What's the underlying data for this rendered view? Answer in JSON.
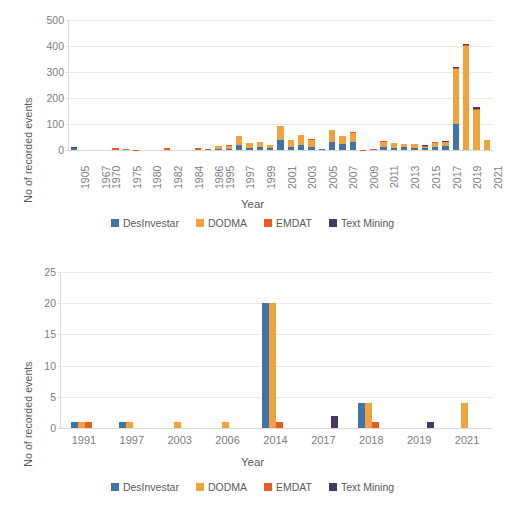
{
  "series_colors": {
    "DesInventar": "#4472a8",
    "DODMA": "#f0a33c",
    "EMDAT": "#ec5b23",
    "Text Mining": "#463963"
  },
  "legend": {
    "items": [
      {
        "label": "DesInvestar",
        "color": "#4472a8",
        "key": "DesInventar"
      },
      {
        "label": "DODMA",
        "color": "#f0a33c",
        "key": "DODMA"
      },
      {
        "label": "EMDAT",
        "color": "#ec5b23",
        "key": "EMDAT"
      },
      {
        "label": "Text Mining",
        "color": "#463963",
        "key": "Text Mining"
      }
    ]
  },
  "chart_data": [
    {
      "id": "top",
      "type": "bar",
      "subtype": "stacked",
      "title": "",
      "xlabel": "Year",
      "ylabel": "No of recorded events",
      "ylim": [
        0,
        500
      ],
      "yticks": [
        0,
        100,
        200,
        300,
        400,
        500
      ],
      "grid": true,
      "legend_position": "bottom",
      "xtick_rotation": -90,
      "categories": [
        "1905",
        "1967",
        "1970",
        "1975",
        "1980",
        "1982",
        "1984",
        "1986",
        "1995",
        "1997",
        "1999",
        "2001",
        "2003",
        "2005",
        "2007",
        "2009",
        "2011",
        "2013",
        "2015",
        "2017",
        "2019",
        "2021"
      ],
      "x": [
        "1905",
        "1966",
        "1967",
        "1970",
        "1974",
        "1975",
        "1979",
        "1980",
        "1981",
        "1982",
        "1983",
        "1984",
        "1985",
        "1986",
        "1995",
        "1996",
        "1997",
        "1998",
        "1999",
        "2000",
        "2001",
        "2002",
        "2003",
        "2004",
        "2005",
        "2006",
        "2007",
        "2008",
        "2009",
        "2010",
        "2011",
        "2012",
        "2013",
        "2014",
        "2015",
        "2016",
        "2017",
        "2018",
        "2019",
        "2020",
        "2021"
      ],
      "series": [
        {
          "name": "DesInvestar",
          "color": "#4472a8",
          "values": [
            8,
            0,
            0,
            0,
            0,
            0,
            0,
            0,
            0,
            0,
            0,
            0,
            0,
            0,
            3,
            4,
            20,
            8,
            12,
            8,
            40,
            10,
            18,
            10,
            2,
            32,
            22,
            30,
            0,
            0,
            10,
            8,
            10,
            8,
            6,
            10,
            14,
            100,
            0,
            0,
            0
          ]
        },
        {
          "name": "DODMA",
          "color": "#f0a33c",
          "values": [
            0,
            0,
            0,
            0,
            0,
            0,
            0,
            0,
            0,
            0,
            0,
            0,
            0,
            0,
            14,
            12,
            33,
            18,
            20,
            12,
            52,
            28,
            38,
            30,
            0,
            44,
            30,
            36,
            0,
            0,
            22,
            18,
            12,
            14,
            6,
            18,
            16,
            212,
            400,
            154,
            38
          ]
        },
        {
          "name": "EMDAT",
          "color": "#ec5b23",
          "values": [
            0,
            0,
            0,
            0,
            8,
            5,
            1,
            0,
            0,
            8,
            0,
            0,
            6,
            4,
            0,
            2,
            0,
            2,
            0,
            0,
            2,
            2,
            2,
            2,
            1,
            2,
            2,
            2,
            1,
            2,
            2,
            2,
            2,
            2,
            2,
            2,
            2,
            3,
            2,
            2,
            0
          ]
        },
        {
          "name": "Text Mining",
          "color": "#463963",
          "values": [
            3,
            0,
            0,
            0,
            0,
            0,
            0,
            0,
            0,
            0,
            0,
            0,
            0,
            0,
            0,
            0,
            0,
            0,
            0,
            0,
            0,
            0,
            0,
            0,
            0,
            0,
            0,
            0,
            0,
            0,
            0,
            0,
            0,
            0,
            4,
            0,
            3,
            3,
            7,
            11,
            0
          ]
        }
      ]
    },
    {
      "id": "bottom",
      "type": "bar",
      "subtype": "clustered",
      "title": "",
      "xlabel": "Year",
      "ylabel": "No of recorded events",
      "ylim": [
        0,
        25
      ],
      "yticks": [
        0,
        5,
        10,
        15,
        20,
        25
      ],
      "grid": true,
      "legend_position": "bottom",
      "xtick_rotation": 0,
      "categories": [
        "1991",
        "1997",
        "2003",
        "2006",
        "2014",
        "2017",
        "2018",
        "2019",
        "2021"
      ],
      "series": [
        {
          "name": "DesInvestar",
          "color": "#4472a8",
          "values": [
            1,
            1,
            0,
            0,
            20,
            0,
            4,
            0,
            0
          ]
        },
        {
          "name": "DODMA",
          "color": "#f0a33c",
          "values": [
            1,
            1,
            1,
            1,
            20,
            0,
            4,
            0,
            4
          ]
        },
        {
          "name": "EMDAT",
          "color": "#ec5b23",
          "values": [
            1,
            0,
            0,
            0,
            1,
            0,
            1,
            0,
            0
          ]
        },
        {
          "name": "Text Mining",
          "color": "#463963",
          "values": [
            0,
            0,
            0,
            0,
            0,
            2,
            0,
            1,
            0
          ]
        }
      ]
    }
  ]
}
